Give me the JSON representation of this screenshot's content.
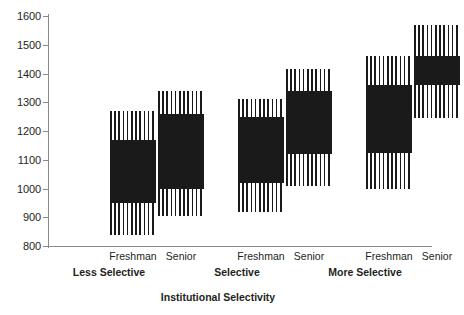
{
  "chart_data": {
    "type": "bar",
    "title": "",
    "xlabel": "Institutional Selectivity",
    "ylabel": "",
    "ylim": [
      800,
      1600
    ],
    "ytick_step": 100,
    "yticks": [
      800,
      900,
      1000,
      1100,
      1200,
      1300,
      1400,
      1500,
      1600
    ],
    "grid": false,
    "legend": false,
    "groups": [
      {
        "label": "Less Selective",
        "bars": [
          {
            "label": "Freshman",
            "outer_low": 840,
            "outer_high": 1270,
            "inner_low": 950,
            "inner_high": 1170
          },
          {
            "label": "Senior",
            "outer_low": 905,
            "outer_high": 1340,
            "inner_low": 1000,
            "inner_high": 1260
          }
        ]
      },
      {
        "label": "Selective",
        "bars": [
          {
            "label": "Freshman",
            "outer_low": 920,
            "outer_high": 1310,
            "inner_low": 1020,
            "inner_high": 1250
          },
          {
            "label": "Senior",
            "outer_low": 1010,
            "outer_high": 1415,
            "inner_low": 1120,
            "inner_high": 1340
          }
        ]
      },
      {
        "label": "More Selective",
        "bars": [
          {
            "label": "Freshman",
            "outer_low": 1000,
            "outer_high": 1460,
            "inner_low": 1125,
            "inner_high": 1360
          },
          {
            "label": "Senior",
            "outer_low": 1245,
            "outer_high": 1570,
            "inner_low": 1360,
            "inner_high": 1460
          }
        ]
      }
    ]
  },
  "colors": {
    "bar_solid": "#1a1a1a",
    "bar_stripe": "#1a1a1a",
    "bar_stripe_bg": "#ffffff",
    "axis": "#8a8a8a",
    "text": "#231f20",
    "background": "#ffffff"
  },
  "layout": {
    "bar_left_px": [
      62,
      110,
      190,
      238,
      318,
      366
    ],
    "group_label_left_px": [
      34,
      162,
      290
    ]
  }
}
